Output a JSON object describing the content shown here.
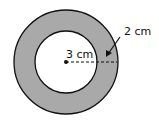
{
  "diagram": {
    "shape": "annulus",
    "ring_color": "#a9a9a9",
    "outline_color": "#111111",
    "inner_radius_label": "3 cm",
    "ring_width_label": "2 cm"
  }
}
